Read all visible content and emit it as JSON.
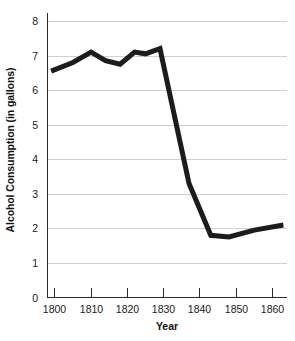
{
  "chart_data": {
    "type": "line",
    "title": "",
    "xlabel": "Year",
    "ylabel": "Alcohol Consumption (in gallons)",
    "xlim": [
      1798,
      1864
    ],
    "ylim": [
      0,
      8
    ],
    "grid": true,
    "legend": false,
    "line_color": "#1c1c1c",
    "gridline_color": "#cfcfcf",
    "axis_color": "#2b2b2b",
    "x_ticks": [
      1800,
      1810,
      1820,
      1830,
      1840,
      1850,
      1860
    ],
    "x_tick_labels": [
      "1800",
      "1810",
      "1820",
      "1830",
      "1840",
      "1850",
      "1860"
    ],
    "y_ticks": [
      0,
      1,
      2,
      3,
      4,
      5,
      6,
      7,
      8
    ],
    "y_tick_labels": [
      "0",
      "1",
      "2",
      "3",
      "4",
      "5",
      "6",
      "7",
      "8"
    ],
    "series": [
      {
        "name": "Alcohol Consumption",
        "x": [
          1799,
          1805,
          1810,
          1814,
          1818,
          1822,
          1825,
          1829,
          1837,
          1843,
          1848,
          1855,
          1863
        ],
        "values": [
          6.55,
          6.8,
          7.1,
          6.85,
          6.75,
          7.1,
          7.05,
          7.2,
          3.3,
          1.8,
          1.75,
          1.95,
          2.1
        ]
      }
    ]
  }
}
